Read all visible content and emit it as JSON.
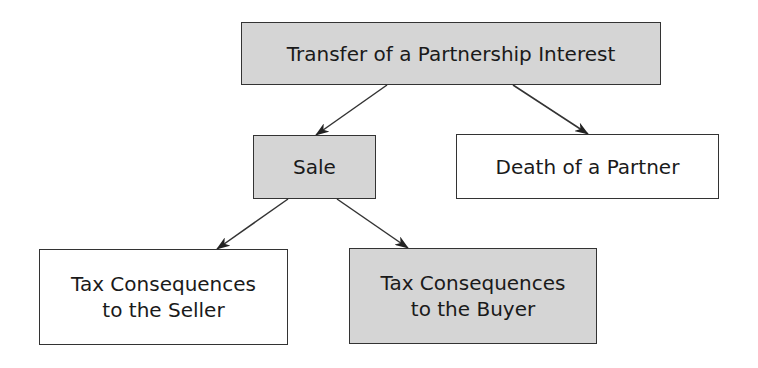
{
  "diagram": {
    "type": "tree",
    "colors": {
      "shaded_fill": "#d5d5d5",
      "plain_fill": "#ffffff",
      "border": "#333333"
    },
    "nodes": {
      "root": {
        "label": "Transfer of a Partnership Interest",
        "style": "shaded"
      },
      "sale": {
        "label": "Sale",
        "style": "shaded"
      },
      "death": {
        "label": "Death of a Partner",
        "style": "plain"
      },
      "seller": {
        "line1": "Tax Consequences",
        "line2": "to the Seller",
        "style": "plain"
      },
      "buyer": {
        "line1": "Tax Consequences",
        "line2": "to the Buyer",
        "style": "shaded"
      }
    },
    "edges": [
      {
        "from": "root",
        "to": "sale"
      },
      {
        "from": "root",
        "to": "death"
      },
      {
        "from": "sale",
        "to": "seller"
      },
      {
        "from": "sale",
        "to": "buyer"
      }
    ]
  }
}
